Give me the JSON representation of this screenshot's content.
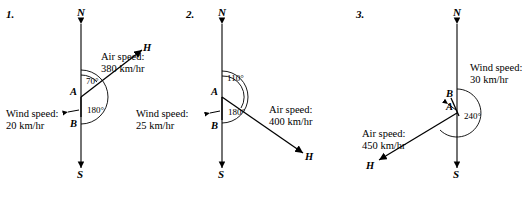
{
  "figures": [
    {
      "number": "1.",
      "axis_top": "N",
      "axis_bottom": "S",
      "points": [
        "A",
        "B",
        "H"
      ],
      "angles": [
        "70°",
        "180°"
      ],
      "labels": {
        "air": "Air speed:\n380 km/hr",
        "wind": "Wind speed:\n20 km/hr"
      }
    },
    {
      "number": "2.",
      "axis_top": "N",
      "axis_bottom": "S",
      "points": [
        "A",
        "B",
        "H"
      ],
      "angles": [
        "110°",
        "180°"
      ],
      "labels": {
        "air": "Air speed:\n400 km/hr",
        "wind": "Wind speed:\n25 km/hr"
      }
    },
    {
      "number": "3.",
      "axis_top": "N",
      "axis_bottom": "S",
      "points": [
        "A",
        "B",
        "H"
      ],
      "angles": [
        "240°"
      ],
      "labels": {
        "air": "Air speed:\n450 km/hr",
        "wind": "Wind speed:\n30 km/hr"
      }
    }
  ]
}
